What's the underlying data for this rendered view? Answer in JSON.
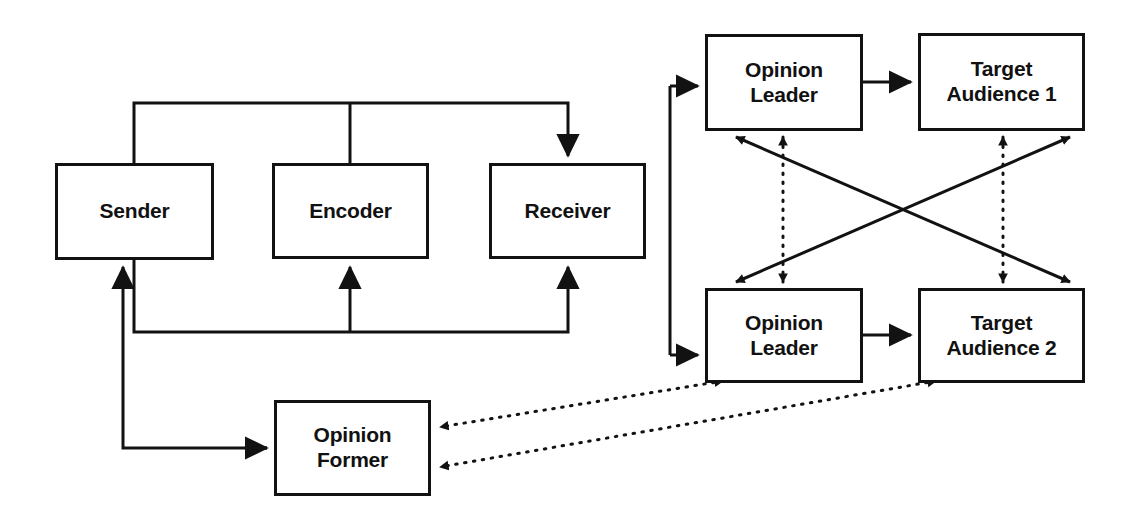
{
  "diagram": {
    "background_color": "#ffffff",
    "line_color": "#121212",
    "nodes": [
      {
        "id": "sender",
        "label": "Sender",
        "x": 55,
        "y": 163,
        "w": 159,
        "h": 97
      },
      {
        "id": "encoder",
        "label": "Encoder",
        "x": 272,
        "y": 163,
        "w": 157,
        "h": 96
      },
      {
        "id": "receiver",
        "label": "Receiver",
        "x": 489,
        "y": 163,
        "w": 157,
        "h": 96
      },
      {
        "id": "opinion-leader-1",
        "label": "Opinion\nLeader",
        "x": 705,
        "y": 34,
        "w": 158,
        "h": 97
      },
      {
        "id": "target-audience-1",
        "label": "Target\nAudience 1",
        "x": 918,
        "y": 33,
        "w": 167,
        "h": 98
      },
      {
        "id": "opinion-leader-2",
        "label": "Opinion\nLeader",
        "x": 705,
        "y": 288,
        "w": 158,
        "h": 95
      },
      {
        "id": "target-audience-2",
        "label": "Target\nAudience 2",
        "x": 918,
        "y": 288,
        "w": 167,
        "h": 95
      },
      {
        "id": "opinion-former",
        "label": "Opinion\nFormer",
        "x": 274,
        "y": 400,
        "w": 157,
        "h": 96
      }
    ],
    "edges": [
      {
        "id": "sender-top-to-receiver",
        "from": "sender",
        "to": "receiver",
        "style": "solid",
        "arrows": "single"
      },
      {
        "id": "encoder-top-to-trunk",
        "from": "encoder",
        "to": "receiver",
        "style": "solid",
        "arrows": "none"
      },
      {
        "id": "sender-bottom-to-receiver",
        "from": "sender",
        "to": "receiver",
        "style": "solid",
        "arrows": "single"
      },
      {
        "id": "feedback-to-encoder",
        "from": "sender",
        "to": "encoder",
        "style": "solid",
        "arrows": "single"
      },
      {
        "id": "receiver-to-opinion-leader-1",
        "from": "receiver",
        "to": "opinion-leader-1",
        "style": "solid",
        "arrows": "single"
      },
      {
        "id": "receiver-to-opinion-leader-2",
        "from": "receiver",
        "to": "opinion-leader-2",
        "style": "solid",
        "arrows": "single"
      },
      {
        "id": "ol1-to-ta1",
        "from": "opinion-leader-1",
        "to": "target-audience-1",
        "style": "solid",
        "arrows": "single"
      },
      {
        "id": "ol2-to-ta2",
        "from": "opinion-leader-2",
        "to": "target-audience-2",
        "style": "solid",
        "arrows": "single"
      },
      {
        "id": "ol1-ta2-diagonal",
        "from": "opinion-leader-1",
        "to": "target-audience-2",
        "style": "solid",
        "arrows": "double"
      },
      {
        "id": "ol2-ta1-diagonal",
        "from": "opinion-leader-2",
        "to": "target-audience-1",
        "style": "solid",
        "arrows": "double"
      },
      {
        "id": "ol1-ol2-dotted",
        "from": "opinion-leader-1",
        "to": "opinion-leader-2",
        "style": "dotted",
        "arrows": "double"
      },
      {
        "id": "ta1-ta2-dotted",
        "from": "target-audience-1",
        "to": "target-audience-2",
        "style": "dotted",
        "arrows": "double"
      },
      {
        "id": "ol2-to-opinion-former-dotted",
        "from": "opinion-leader-2",
        "to": "opinion-former",
        "style": "dotted",
        "arrows": "double"
      },
      {
        "id": "ta2-to-opinion-former-dotted",
        "from": "target-audience-2",
        "to": "opinion-former",
        "style": "dotted",
        "arrows": "double"
      },
      {
        "id": "opinion-former-to-sender",
        "from": "opinion-former",
        "to": "sender",
        "style": "solid",
        "arrows": "single"
      }
    ]
  }
}
